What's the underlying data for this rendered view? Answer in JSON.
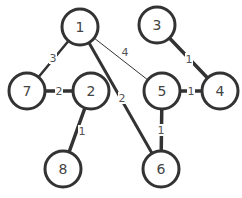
{
  "graph": {
    "nodes": [
      {
        "id": "1",
        "label": "1",
        "x": 80,
        "y": 27
      },
      {
        "id": "3",
        "label": "3",
        "x": 157,
        "y": 25
      },
      {
        "id": "7",
        "label": "7",
        "x": 27,
        "y": 91
      },
      {
        "id": "2",
        "label": "2",
        "x": 91,
        "y": 91
      },
      {
        "id": "5",
        "label": "5",
        "x": 162,
        "y": 91
      },
      {
        "id": "4",
        "label": "4",
        "x": 220,
        "y": 91
      },
      {
        "id": "8",
        "label": "8",
        "x": 63,
        "y": 169
      },
      {
        "id": "6",
        "label": "6",
        "x": 161,
        "y": 169
      }
    ],
    "edges": [
      {
        "from": "1",
        "to": "7",
        "weight": "3",
        "lx": 53,
        "ly": 58,
        "width": 2.5
      },
      {
        "from": "1",
        "to": "5",
        "weight": "4",
        "lx": 125,
        "ly": 52,
        "width": 1
      },
      {
        "from": "1",
        "to": "6",
        "weight": "2",
        "lx": 122,
        "ly": 98,
        "width": 3
      },
      {
        "from": "7",
        "to": "2",
        "weight": "2",
        "lx": 59,
        "ly": 91,
        "width": 3.5
      },
      {
        "from": "2",
        "to": "8",
        "weight": "1",
        "lx": 82,
        "ly": 131,
        "width": 3.5
      },
      {
        "from": "3",
        "to": "4",
        "weight": "1",
        "lx": 189,
        "ly": 59,
        "width": 3.5
      },
      {
        "from": "5",
        "to": "4",
        "weight": "1",
        "lx": 191,
        "ly": 91,
        "width": 3.5
      },
      {
        "from": "5",
        "to": "6",
        "weight": "1",
        "lx": 161,
        "ly": 130,
        "width": 3.5
      }
    ],
    "node_radius": 18
  }
}
